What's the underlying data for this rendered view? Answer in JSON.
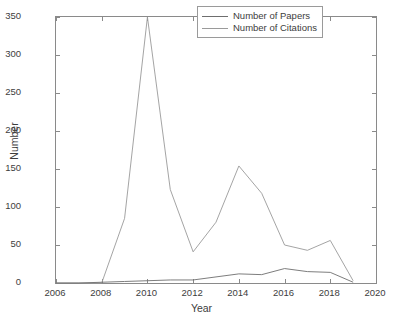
{
  "chart_data": {
    "type": "line",
    "title": "",
    "xlabel": "Year",
    "ylabel": "Number",
    "xlim": [
      2006,
      2020
    ],
    "ylim": [
      0,
      350
    ],
    "xticks": [
      2006,
      2008,
      2010,
      2012,
      2014,
      2016,
      2018,
      2020
    ],
    "yticks": [
      0,
      50,
      100,
      150,
      200,
      250,
      300,
      350
    ],
    "grid": false,
    "legend_position": "top-right",
    "x": [
      2006,
      2007,
      2008,
      2009,
      2010,
      2011,
      2012,
      2013,
      2014,
      2015,
      2016,
      2017,
      2018,
      2019
    ],
    "series": [
      {
        "name": "Number of Papers",
        "color": "#6e6e6e",
        "values": [
          0,
          0,
          1,
          2,
          3,
          4,
          4,
          8,
          12,
          11,
          19,
          15,
          14,
          1
        ]
      },
      {
        "name": "Number of Citations",
        "color": "#9a9a9a",
        "values": [
          0,
          0,
          0,
          85,
          350,
          123,
          41,
          80,
          154,
          118,
          50,
          43,
          56,
          3
        ]
      }
    ]
  },
  "legend": {
    "items": [
      {
        "label": "Number of Papers"
      },
      {
        "label": "Number of Citations"
      }
    ]
  },
  "axes": {
    "x_title": "Year",
    "y_title": "Number",
    "x_tick_labels": [
      "2006",
      "2008",
      "2010",
      "2012",
      "2014",
      "2016",
      "2018",
      "2020"
    ],
    "y_tick_labels": [
      "0",
      "50",
      "100",
      "150",
      "200",
      "250",
      "300",
      "350"
    ]
  }
}
